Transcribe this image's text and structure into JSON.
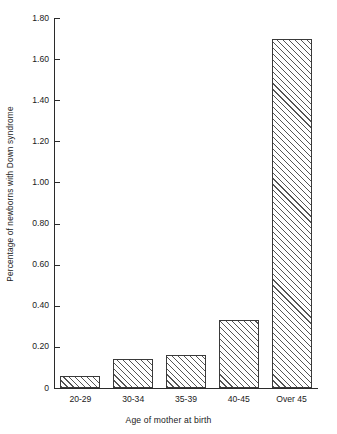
{
  "chart_data": {
    "type": "bar",
    "title": "",
    "xlabel": "Age of mother at birth",
    "ylabel": "Percentage of newborns with Down syndrome",
    "categories": [
      "20-29",
      "30-34",
      "35-39",
      "40-45",
      "Over 45"
    ],
    "values": [
      0.06,
      0.14,
      0.16,
      0.33,
      1.7
    ],
    "ylim": [
      0,
      1.8
    ],
    "yticks": [
      "0",
      "0.20",
      "0.40",
      "0.60",
      "0.80",
      "1.00",
      "1.20",
      "1.40",
      "1.60",
      "1.80"
    ],
    "ytick_values": [
      0,
      0.2,
      0.4,
      0.6,
      0.8,
      1.0,
      1.2,
      1.4,
      1.6,
      1.8
    ],
    "grid": false,
    "legend": null,
    "bar_fill": "hatched-diagonal",
    "bar_edge_color": "#3a3a3a",
    "axis_color": "#2b2b2b",
    "background": "#ffffff"
  }
}
